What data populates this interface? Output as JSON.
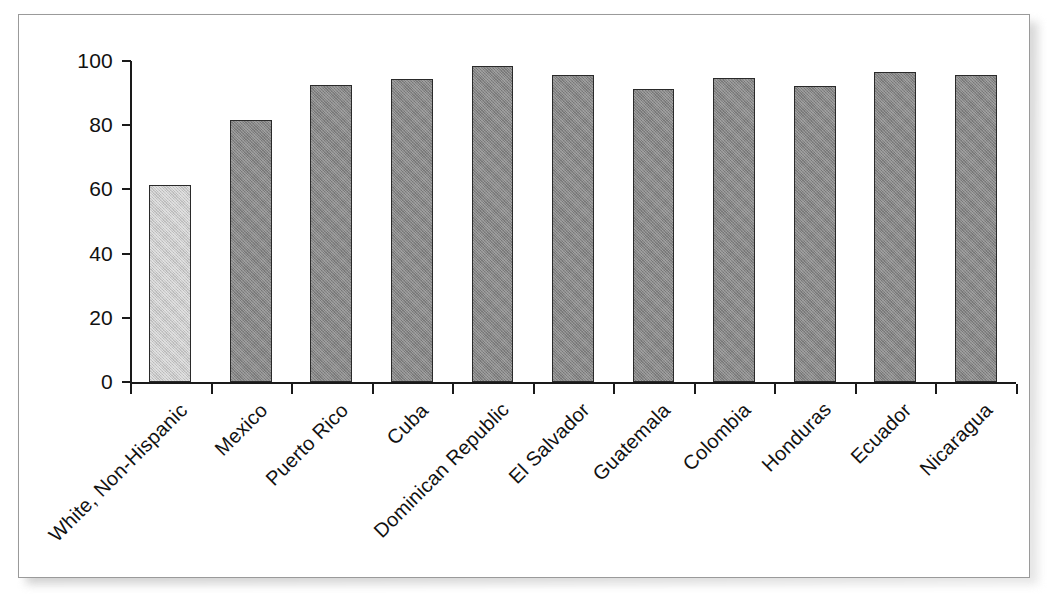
{
  "chart_data": {
    "type": "bar",
    "title": "",
    "subtitle": "",
    "xlabel": "",
    "ylabel": "",
    "ylim": [
      0,
      100
    ],
    "yticks": [
      0,
      20,
      40,
      60,
      80,
      100
    ],
    "ytick_labels": [
      "0",
      "20",
      "40",
      "60",
      "80",
      "100"
    ],
    "grid": false,
    "legend": "none",
    "categories": [
      "White, Non-Hispanic",
      "Mexico",
      "Puerto Rico",
      "Cuba",
      "Dominican Republic",
      "El Salvador",
      "Guatemala",
      "Colombia",
      "Honduras",
      "Ecuador",
      "Nicaragua"
    ],
    "values": [
      61.5,
      81.5,
      92.5,
      94.5,
      98.3,
      95.5,
      91.3,
      94.8,
      92.3,
      96.5,
      95.5
    ],
    "bar_styles": [
      "highlight",
      "standard",
      "standard",
      "standard",
      "standard",
      "standard",
      "standard",
      "standard",
      "standard",
      "standard",
      "standard"
    ],
    "colors": {
      "bar_standard": "#858585",
      "bar_highlight": "#c9c9c9",
      "bar_border": "#2a2a2a",
      "axis": "#1a1a1a",
      "text": "#111111",
      "panel_background": "#ffffff",
      "panel_border": "#9a9a9a",
      "shadow": "#b4b4b4"
    }
  }
}
